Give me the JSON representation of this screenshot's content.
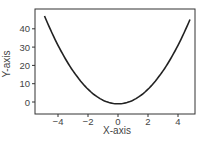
{
  "chart_data": {
    "type": "line",
    "title": "",
    "xlabel": "X-axis",
    "ylabel": "Y-axis",
    "xlim": [
      -5.5,
      5.2
    ],
    "ylim": [
      -6,
      51
    ],
    "xticks": [
      -4,
      -2,
      0,
      2,
      4
    ],
    "yticks": [
      0,
      10,
      20,
      30,
      40
    ],
    "xtick_labels": [
      "−4",
      "−2",
      "0",
      "2",
      "4"
    ],
    "ytick_labels": [
      "0",
      "10",
      "20",
      "30",
      "40"
    ],
    "grid": false,
    "legend": null,
    "series": [
      {
        "name": "y = 2x^2 - 1",
        "x": [
          -4.9,
          -4,
          -3,
          -2,
          -1,
          -0.3,
          0,
          1,
          2,
          3,
          4,
          4.8
        ],
        "values": [
          47,
          31,
          17,
          7,
          1,
          -1,
          -1,
          1,
          7,
          17,
          31,
          45
        ],
        "color": "#222222"
      }
    ]
  }
}
